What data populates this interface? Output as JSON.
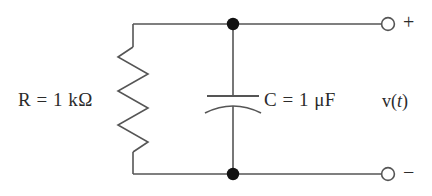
{
  "figure": {
    "kind": "circuit-schematic",
    "background_color": "#ffffff",
    "line_color": "#555555",
    "node_color": "#111111",
    "text_color": "#2b2b2b"
  },
  "labels": {
    "resistor": "R = 1 kΩ",
    "capacitor": "C = 1 μF",
    "voltage_prefix": "v(",
    "voltage_variable": "t",
    "voltage_suffix": ")",
    "terminal_positive": "+",
    "terminal_negative": "−"
  },
  "components": {
    "resistor": {
      "name": "R",
      "value": "1",
      "unit": "kΩ",
      "symbol": "zigzag",
      "orientation": "vertical"
    },
    "capacitor": {
      "name": "C",
      "value": "1",
      "unit": "μF",
      "symbol": "curved-plate",
      "orientation": "vertical"
    },
    "terminals": [
      {
        "polarity": "+",
        "style": "open-circle",
        "position": "top-right"
      },
      {
        "polarity": "−",
        "style": "open-circle",
        "position": "bottom-right"
      }
    ],
    "junction_nodes": [
      {
        "position": "top-middle",
        "style": "filled-dot"
      },
      {
        "position": "bottom-middle",
        "style": "filled-dot"
      }
    ]
  }
}
